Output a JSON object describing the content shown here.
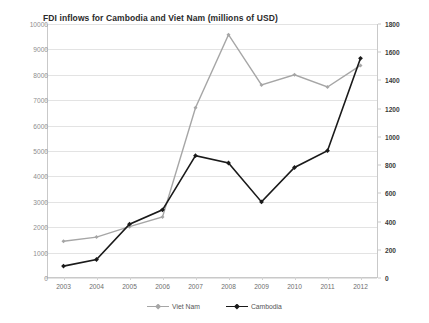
{
  "chart_data": {
    "type": "line",
    "title": "FDI inflows for Cambodia and Viet Nam (millions of USD)",
    "xlabel": "",
    "ylabel": "",
    "grid": true,
    "legend_position": "bottom",
    "categories": [
      "2003",
      "2004",
      "2005",
      "2006",
      "2007",
      "2008",
      "2009",
      "2010",
      "2011",
      "2012"
    ],
    "left_axis": {
      "name": "Viet Nam axis",
      "ylim": [
        0,
        10000
      ],
      "tick_step": 1000,
      "ticks": [
        "0",
        "1000",
        "2000",
        "3000",
        "4000",
        "5000",
        "6000",
        "7000",
        "8000",
        "9000",
        "10000"
      ]
    },
    "right_axis": {
      "name": "Cambodia axis",
      "ylim": [
        0,
        1800
      ],
      "tick_step": 200,
      "ticks": [
        "0",
        "200",
        "400",
        "600",
        "800",
        "1000",
        "1200",
        "1400",
        "1600",
        "1800"
      ]
    },
    "series": [
      {
        "name": "Viet Nam",
        "axis": "left",
        "color": "#a6a6a6",
        "marker": "diamond",
        "values": [
          1450,
          1610,
          2020,
          2400,
          6700,
          9580,
          7600,
          8000,
          7520,
          8370
        ]
      },
      {
        "name": "Cambodia",
        "axis": "right",
        "color": "#1a1a1a",
        "marker": "diamond",
        "values": [
          84,
          131,
          381,
          483,
          867,
          815,
          539,
          783,
          902,
          1557
        ]
      }
    ]
  },
  "legend": {
    "items": [
      {
        "label": "Viet Nam"
      },
      {
        "label": "Cambodia"
      }
    ]
  },
  "colors": {
    "viet_nam": "#a6a6a6",
    "cambodia": "#1a1a1a",
    "grid": "#e3e3e3",
    "axis": "#c9c9c9",
    "background": "#ffffff"
  }
}
